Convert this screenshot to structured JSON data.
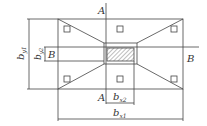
{
  "diagram": {
    "section_marks": {
      "a_top": "A",
      "a_bottom": "A",
      "b_left": "B",
      "b_right": "B"
    },
    "dimensions": {
      "by1": {
        "base": "b",
        "sub": "y1"
      },
      "by2": {
        "base": "b",
        "sub": "y2"
      },
      "bx1": {
        "base": "b",
        "sub": "x1"
      },
      "bx2": {
        "base": "b",
        "sub": "x2"
      }
    },
    "colors": {
      "line": "#444444",
      "background": "#ffffff"
    }
  }
}
